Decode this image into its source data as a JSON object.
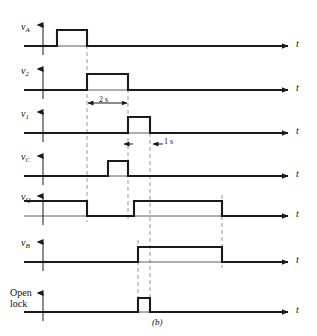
{
  "figure": {
    "caption": "(b)",
    "axis_time_label": "t",
    "colors": {
      "trace": "#1a1a1a",
      "axis": "#4d4d4d",
      "dashed": "#9a9a9a",
      "background": "#ffffff"
    },
    "dimensions": [
      {
        "name": "pulse-width-2s",
        "label": "2 s"
      },
      {
        "name": "delay-1s",
        "label": "1 s"
      }
    ],
    "signals": [
      {
        "name": "vA",
        "label_main": "v",
        "label_sub": "A",
        "baseline_y": 46,
        "high_y": 30,
        "initial_level": "low",
        "edges": [
          {
            "x": 57,
            "to": "high"
          },
          {
            "x": 87,
            "to": "low"
          }
        ]
      },
      {
        "name": "v2",
        "label_main": "v",
        "label_sub": "2",
        "baseline_y": 90,
        "high_y": 74,
        "initial_level": "low",
        "edges": [
          {
            "x": 87,
            "to": "high"
          },
          {
            "x": 128,
            "to": "low"
          }
        ]
      },
      {
        "name": "v1",
        "label_main": "v",
        "label_sub": "1",
        "baseline_y": 133,
        "high_y": 117,
        "initial_level": "low",
        "edges": [
          {
            "x": 128,
            "to": "high"
          },
          {
            "x": 150,
            "to": "low"
          }
        ]
      },
      {
        "name": "vC",
        "label_main": "v",
        "label_sub": "C",
        "baseline_y": 176,
        "high_y": 161,
        "initial_level": "low",
        "edges": [
          {
            "x": 108,
            "to": "high"
          },
          {
            "x": 128,
            "to": "low"
          }
        ]
      },
      {
        "name": "vQ",
        "label_main": "v",
        "label_sub": "Q",
        "baseline_y": 216,
        "high_y": 201,
        "initial_level": "high",
        "edges": [
          {
            "x": 87,
            "to": "low"
          },
          {
            "x": 134,
            "to": "high"
          },
          {
            "x": 222,
            "to": "low"
          }
        ]
      },
      {
        "name": "vB",
        "label_main": "v",
        "label_sub": "B",
        "baseline_y": 262,
        "high_y": 247,
        "initial_level": "low",
        "edges": [
          {
            "x": 138,
            "to": "high"
          },
          {
            "x": 222,
            "to": "low"
          }
        ]
      },
      {
        "name": "open-lock",
        "label_main": "Open",
        "label_sub": "lock",
        "baseline_y": 312,
        "high_y": 298,
        "initial_level": "low",
        "edges": [
          {
            "x": 138,
            "to": "high"
          },
          {
            "x": 150,
            "to": "low"
          }
        ]
      }
    ],
    "dashed_markers": [
      {
        "name": "marker-t1",
        "x": 87,
        "y1": 38,
        "y2": 222
      },
      {
        "name": "marker-t2",
        "x": 128,
        "y1": 82,
        "y2": 222
      },
      {
        "name": "marker-t3",
        "x": 138,
        "y1": 240,
        "y2": 312
      },
      {
        "name": "marker-t4",
        "x": 150,
        "y1": 126,
        "y2": 312
      },
      {
        "name": "marker-t5",
        "x": 222,
        "y1": 195,
        "y2": 268
      }
    ]
  }
}
